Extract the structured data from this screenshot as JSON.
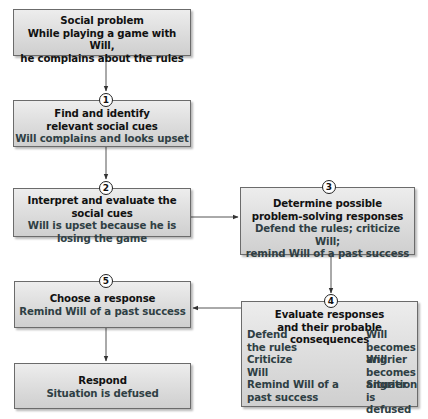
{
  "diagram": {
    "nodes": [
      {
        "id": "social-problem",
        "step": null,
        "title": [
          "Social problem"
        ],
        "detail": [
          "While playing a game with Will,",
          "he complains about the rules"
        ]
      },
      {
        "id": "find-cues",
        "step": "1",
        "title": [
          "Find and identify",
          "relevant social cues"
        ],
        "detail": [
          "Will complains and looks upset"
        ]
      },
      {
        "id": "interpret-cues",
        "step": "2",
        "title": [
          "Interpret and evaluate the social cues"
        ],
        "detail": [
          "Will is upset because he is",
          "losing the game"
        ]
      },
      {
        "id": "determine-responses",
        "step": "3",
        "title": [
          "Determine possible",
          "problem-solving responses"
        ],
        "detail": [
          "Defend the rules; criticize Will;",
          "remind Will of a past success"
        ]
      },
      {
        "id": "evaluate-responses",
        "step": "4",
        "title": [
          "Evaluate responses",
          "and their probable consequences"
        ],
        "evaluations": [
          {
            "response": [
              "Defend",
              "the rules"
            ],
            "consequence": [
              "Will becomes",
              "angrier"
            ]
          },
          {
            "response": [
              "Criticize",
              "Will"
            ],
            "consequence": [
              "Will becomes",
              "angrier"
            ]
          },
          {
            "response": [
              "Remind Will of a",
              "past success"
            ],
            "consequence": [
              "Situation is",
              "defused"
            ]
          }
        ]
      },
      {
        "id": "choose-response",
        "step": "5",
        "title": [
          "Choose a response"
        ],
        "detail": [
          "Remind Will of a past success"
        ]
      },
      {
        "id": "respond",
        "step": null,
        "title": [
          "Respond"
        ],
        "detail": [
          "Situation is defused"
        ]
      }
    ],
    "edges": [
      {
        "from": "social-problem",
        "to": "find-cues"
      },
      {
        "from": "find-cues",
        "to": "interpret-cues"
      },
      {
        "from": "interpret-cues",
        "to": "determine-responses"
      },
      {
        "from": "determine-responses",
        "to": "evaluate-responses"
      },
      {
        "from": "evaluate-responses",
        "to": "choose-response"
      },
      {
        "from": "choose-response",
        "to": "respond"
      }
    ],
    "colors": {
      "box_fill_top": "#ededed",
      "box_fill_bottom": "#cfcfcf",
      "border": "#6b6b6b",
      "title_text": "#111111",
      "detail_text": "#2f3f44"
    }
  }
}
